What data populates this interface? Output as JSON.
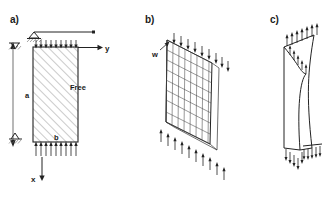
{
  "figure": {
    "background_color": "#ffffff",
    "line_color": "#222222",
    "hatch_color": "#6a6a6a",
    "panels": [
      {
        "id": "panel-a",
        "label": "a)",
        "description": "Hatched rectangular plate with coordinate axes, supports and distributed edge loads",
        "labels": {
          "axis_x": "x",
          "axis_y": "y",
          "dim_a": "a",
          "dim_b": "b",
          "free_edge": "Free"
        }
      },
      {
        "id": "panel-b",
        "label": "b)",
        "description": "Three dimensional perspective mesh of the plate under compressive edge loading",
        "labels": {
          "load": "w"
        }
      },
      {
        "id": "panel-c",
        "label": "c)",
        "description": "Buckled deformed shape of the plate with edge loads",
        "labels": {}
      }
    ]
  }
}
